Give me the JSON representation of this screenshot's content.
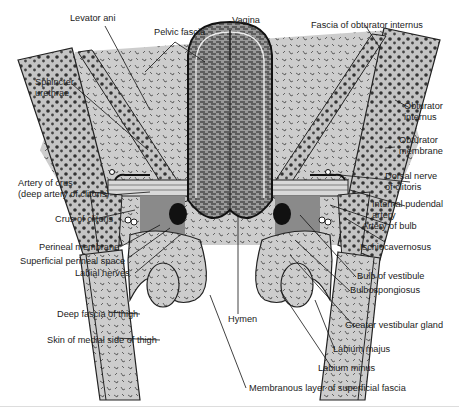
{
  "figure": {
    "signature": "vmc",
    "colors": {
      "tissue_gray": "#c8c8c8",
      "muscle_gray": "#b4b4b4",
      "vagina_dark": "#6e6e6e",
      "line": "#1a1a1a",
      "background": "#ffffff"
    }
  },
  "labels": {
    "levator_ani": "Levator ani",
    "pelvic_fascia": "Pelvic fascia",
    "vagina": "Vagina",
    "fascia_obturator_internus": "Fascia of obturator internus",
    "sphincter_urethrae_1": "Sphincter",
    "sphincter_urethrae_2": "urethrae",
    "obturator_internus_1": "Obturator",
    "obturator_internus_2": "internus",
    "obturator_membrane_1": "Obturator",
    "obturator_membrane_2": "membrane",
    "artery_of_crus_1": "Artery of crus",
    "artery_of_crus_2": "(deep artery of clitoris)",
    "dorsal_nerve_1": "Dorsal nerve",
    "dorsal_nerve_2": "of clitoris",
    "crus_of_clitoris": "Crus of clitoris",
    "internal_pudendal_1": "Internal pudendal",
    "internal_pudendal_2": "artery",
    "artery_of_bulb": "Artery of bulb",
    "perineal_membrane": "Perineal membrane",
    "ischiocavernosus": "Ischiocavernosus",
    "superficial_perineal_space": "Superficial perineal space",
    "labial_nerves": "Labial nerves",
    "bulb_of_vestibule": "Bulb of vestibule",
    "bulbospongiosus": "Bulbospongiosus",
    "deep_fascia_thigh": "Deep fascia of thigh",
    "greater_vestibular_gland": "Greater vestibular gland",
    "hymen": "Hymen",
    "skin_medial_thigh": "Skin of medial side of thigh",
    "labium_majus": "Labium majus",
    "labium_minus": "Labium minus",
    "membranous_layer": "Membranous layer of superficial fascia"
  }
}
